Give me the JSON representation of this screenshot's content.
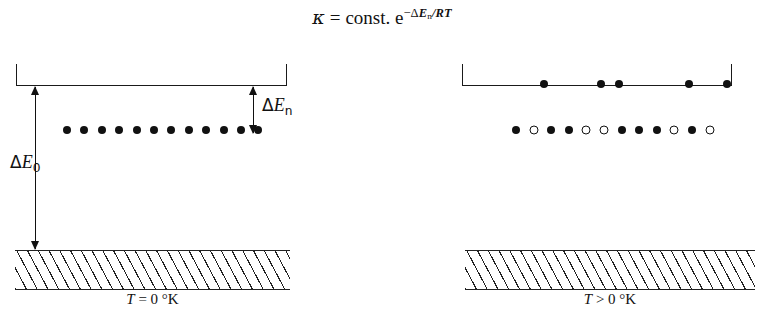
{
  "equation": {
    "kappa": "κ",
    "equals": "=",
    "const": "const. e",
    "exponent_minus": "−",
    "exponent_delta": "Δ",
    "exponent_E": "E",
    "exponent_sub": "n",
    "exponent_over": "/",
    "exponent_RT": "RT",
    "full_text": "κ = const. e−ΔEn/RT"
  },
  "left_panel": {
    "temperature_label_T": "T",
    "temperature_label_rest": " = 0 °K",
    "temperature_label": "T = 0 °K",
    "delta_en_symbol": "Δ",
    "delta_en_E": "E",
    "delta_en_sub": "n",
    "delta_en_label": "ΔEn",
    "delta_e0_symbol": "Δ",
    "delta_e0_E": "E",
    "delta_e0_sub": "0",
    "delta_e0_label": "ΔE0",
    "dot_row": [
      "filled",
      "filled",
      "filled",
      "filled",
      "filled",
      "filled",
      "filled",
      "filled",
      "filled",
      "filled",
      "filled",
      "filled"
    ],
    "dot_count": 12
  },
  "right_panel": {
    "temperature_label_T": "T",
    "temperature_label_rest": " > 0 °K",
    "temperature_label": "T > 0 °K",
    "excited_dots": [
      "filled",
      "filled",
      "filled",
      "filled",
      "filled"
    ],
    "excited_dot_count": 5,
    "ground_row": [
      "filled",
      "open",
      "filled",
      "filled",
      "open",
      "open",
      "filled",
      "filled",
      "filled",
      "open",
      "filled",
      "open"
    ],
    "ground_dot_count": 12
  },
  "caption": {
    "text": ""
  },
  "colors": {
    "ink": "#111111",
    "hatch": "#222222",
    "background": "#ffffff",
    "caption_gray": "#8d8d8d"
  }
}
